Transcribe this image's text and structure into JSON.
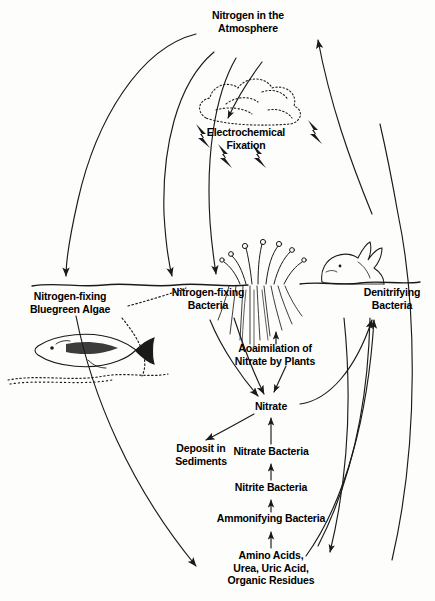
{
  "diagram": {
    "background_color": "#fdfdfc",
    "ink_color": "#1a1a1a",
    "nodes": {
      "atmosphere": {
        "label": "Nitrogen in the\nAtmosphere",
        "x": 248,
        "y": 16
      },
      "electrochemical": {
        "label": "Electrochemical\nFixation",
        "x": 246,
        "y": 132
      },
      "algae": {
        "label": "Nitrogen-fixing\nBluegreen Algae",
        "x": 70,
        "y": 296
      },
      "bacteria_soil": {
        "label": "Nitrogen-fixing\nBacteria",
        "x": 208,
        "y": 292
      },
      "denitrifying": {
        "label": "Denitrifying\nBacteria",
        "x": 392,
        "y": 292
      },
      "assimilation": {
        "label": "Aoaimilation of\nNitrate by Plants",
        "x": 275,
        "y": 348
      },
      "nitrate": {
        "label": "Nitrate",
        "x": 271,
        "y": 406
      },
      "deposit": {
        "label": "Deposit in\nSediments",
        "x": 201,
        "y": 448
      },
      "nitrate_bacteria": {
        "label": "Nitrate Bacteria",
        "x": 271,
        "y": 451
      },
      "nitrite_bacteria": {
        "label": "Nitrite Bacteria",
        "x": 271,
        "y": 487
      },
      "ammonifying_bacteria": {
        "label": "Ammonifying Bacteria",
        "x": 271,
        "y": 518
      },
      "organic": {
        "label": "Amino Acids,\nUrea, Uric Acid,\nOrganic Residues",
        "x": 271,
        "y": 555
      }
    },
    "illustrations": [
      {
        "name": "cloud-illustration",
        "description": "stippled cloud"
      },
      {
        "name": "lightning-bolt-icon",
        "description": "lightning bolts"
      },
      {
        "name": "plant-illustration",
        "description": "plant with roots"
      },
      {
        "name": "rabbit-illustration",
        "description": "rabbit"
      },
      {
        "name": "fish-illustration",
        "description": "fish"
      },
      {
        "name": "waterline-illustration",
        "description": "water surface line"
      },
      {
        "name": "soil-line-illustration",
        "description": "ground surface line"
      },
      {
        "name": "sediment-illustration",
        "description": "sediment on lake bed"
      }
    ]
  }
}
